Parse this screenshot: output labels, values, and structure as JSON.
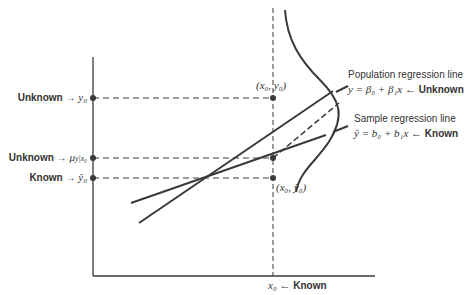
{
  "diagram": {
    "left_labels": [
      {
        "word": "Unknown",
        "arrow": "→",
        "symbol": "y₀"
      },
      {
        "word": "Unknown",
        "arrow": "→",
        "symbol": "μ",
        "sub": "y|x₀"
      },
      {
        "word": "Known",
        "arrow": "→",
        "symbol": "ŷ₀"
      }
    ],
    "point_labels": {
      "top": "(x₀, y₀)",
      "bottom": "(x₀, ŷ₀)"
    },
    "population": {
      "title": "Population regression line",
      "equation": "y = β₀ + β₁x ←",
      "status": "Unknown"
    },
    "sample": {
      "title": "Sample regression line",
      "equation": "ŷ = b₀ + b₁x ←",
      "status": "Known"
    },
    "x_label": {
      "symbol": "x₀ ←",
      "status": "Known"
    },
    "colors": {
      "line": "#3a3a3a",
      "background": "#ffffff"
    }
  }
}
